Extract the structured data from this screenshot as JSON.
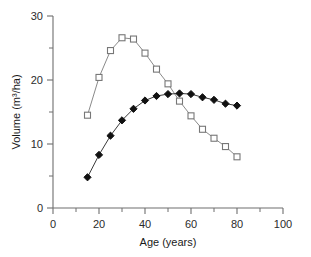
{
  "chart_data": {
    "type": "line",
    "title": "",
    "xlabel": "Age (years)",
    "ylabel": "Volume (m³/ha)",
    "xlim": [
      0,
      100
    ],
    "ylim": [
      0,
      30
    ],
    "xticks": [
      0,
      20,
      40,
      60,
      80,
      100
    ],
    "xtick_labels": [
      "0",
      "20",
      "40",
      "60",
      "80",
      "100"
    ],
    "xminor_ticks": [
      10,
      30,
      50,
      70,
      90
    ],
    "yticks": [
      0,
      10,
      20,
      30
    ],
    "ytick_labels": [
      "0",
      "10",
      "20",
      "30"
    ],
    "yminor_ticks": [
      5,
      15,
      25
    ],
    "grid": false,
    "legend": false,
    "legend_position": "none",
    "series": [
      {
        "name": "open-square-series",
        "marker": "open-square",
        "color": "#8a8a8a",
        "x": [
          15,
          20,
          25,
          30,
          35,
          40,
          45,
          50,
          55,
          60,
          65,
          70,
          75,
          80
        ],
        "values": [
          14.5,
          20.4,
          24.6,
          26.6,
          26.4,
          24.2,
          21.7,
          19.4,
          16.7,
          14.4,
          12.3,
          10.9,
          9.6,
          8.0
        ]
      },
      {
        "name": "filled-diamond-series",
        "marker": "filled-diamond",
        "color": "#111111",
        "x": [
          15,
          20,
          25,
          30,
          35,
          40,
          45,
          50,
          55,
          60,
          65,
          70,
          75,
          80
        ],
        "values": [
          4.8,
          8.3,
          11.3,
          13.7,
          15.5,
          16.8,
          17.5,
          17.8,
          17.9,
          17.8,
          17.3,
          16.9,
          16.3,
          16.0
        ]
      }
    ]
  }
}
